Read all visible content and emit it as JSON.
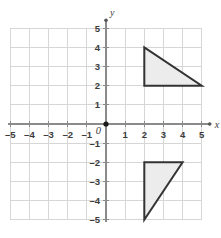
{
  "figure": {
    "title": "",
    "origin_label": "0",
    "background_color": "#ffffff"
  },
  "chart_data": {
    "type": "scatter",
    "title": "",
    "xlabel": "x",
    "ylabel": "y",
    "xlim": [
      -5,
      5
    ],
    "ylim": [
      -5,
      5
    ],
    "grid": true,
    "grid_step": 1,
    "legend": "none",
    "x_tick_labels": [
      "–5",
      "–4",
      "–3",
      "–2",
      "–1",
      "1",
      "2",
      "3",
      "4",
      "5"
    ],
    "x_tick_values": [
      -5,
      -4,
      -3,
      -2,
      -1,
      1,
      2,
      3,
      4,
      5
    ],
    "y_tick_labels": [
      "5",
      "4",
      "3",
      "2",
      "1",
      "–1",
      "–2",
      "–3",
      "–4",
      "–5"
    ],
    "y_tick_values": [
      5,
      4,
      3,
      2,
      1,
      -1,
      -2,
      -3,
      -4,
      -5
    ],
    "origin_point": [
      0,
      0
    ],
    "shapes": [
      {
        "name": "upper-triangle",
        "type": "triangle",
        "vertices": [
          [
            2,
            4
          ],
          [
            2,
            2
          ],
          [
            5,
            2
          ]
        ],
        "fill": "#ececec",
        "stroke": "#333333",
        "stroke_width": 2
      },
      {
        "name": "lower-triangle",
        "type": "triangle",
        "vertices": [
          [
            2,
            -2
          ],
          [
            4,
            -2
          ],
          [
            2,
            -5
          ]
        ],
        "fill": "#ececec",
        "stroke": "#333333",
        "stroke_width": 2
      }
    ],
    "colors": {
      "grid": "#d6d6d6",
      "axis": "#8a8a8a",
      "shape_fill": "#ececec",
      "shape_stroke": "#333333",
      "text": "#3b3b3b"
    }
  }
}
